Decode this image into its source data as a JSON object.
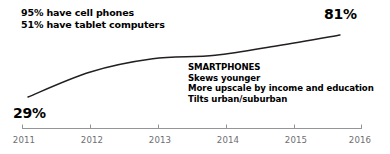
{
  "chart_data": {
    "type": "line",
    "title": "",
    "subtitle": "",
    "xlabel": "",
    "ylabel": "",
    "x": [
      2011,
      2012,
      2013,
      2014,
      2015,
      2016
    ],
    "categories": [
      "2011",
      "2012",
      "2013",
      "2014",
      "2015",
      "2016"
    ],
    "series": [
      {
        "name": "Smartphones",
        "values": [
          29,
          50,
          61,
          64,
          72,
          81
        ]
      }
    ],
    "values": [
      29,
      50,
      61,
      64,
      72,
      81
    ],
    "ylim": [
      0,
      100
    ],
    "xlim": [
      2011,
      2016
    ],
    "grid": false,
    "legend": false,
    "data_labels": {
      "first": "29%",
      "last": "81%"
    },
    "line_color": "#231f20",
    "axis_color": "#939598",
    "tick_label_color": "#6d6e71",
    "annotations": [
      {
        "name": "top-left-note",
        "lines": [
          "95% have cell phones",
          "51% have tablet computers"
        ]
      },
      {
        "name": "smartphones-note",
        "lines": [
          "SMARTPHONES",
          "Skews younger",
          "More upscale by income and education",
          "Tilts urban/suburban"
        ]
      }
    ]
  },
  "notes": {
    "top_left": {
      "line1": "95% have cell phones",
      "line2": "51% have tablet computers"
    },
    "smartphones": {
      "heading": "SMARTPHONES",
      "line1": "Skews younger",
      "line2": "More upscale by income and education",
      "line3": "Tilts urban/suburban"
    }
  },
  "labels": {
    "start_value": "29%",
    "end_value": "81%"
  },
  "axis": {
    "ticks": [
      "2011",
      "2012",
      "2013",
      "2014",
      "2015",
      "2016"
    ]
  }
}
